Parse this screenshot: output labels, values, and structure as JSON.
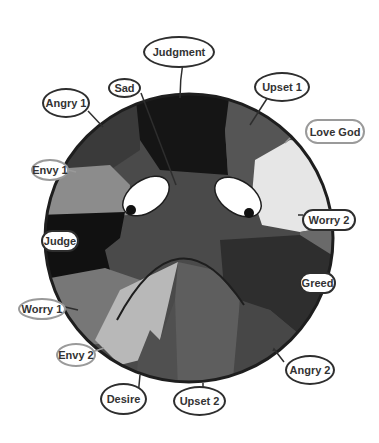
{
  "diagram": {
    "colors": {
      "outline": "#1e1e1e",
      "black_region": "#111111",
      "dark_gray": "#2f2f2f",
      "mid_dark_gray": "#444444",
      "mid_gray": "#5a5a5a",
      "gray": "#6e6e6e",
      "light_gray": "#8a8a8a",
      "pale_gray": "#b9b9b9",
      "near_white": "#ececec",
      "eye_white": "#ffffff",
      "pupil": "#111111"
    },
    "labels": [
      {
        "id": "judgment",
        "text": "Judgment"
      },
      {
        "id": "sad",
        "text": "Sad"
      },
      {
        "id": "angry1",
        "text": "Angry 1"
      },
      {
        "id": "upset1",
        "text": "Upset 1"
      },
      {
        "id": "love_god",
        "text": "Love God"
      },
      {
        "id": "envy1",
        "text": "Envy 1"
      },
      {
        "id": "worry2",
        "text": "Worry 2"
      },
      {
        "id": "judge",
        "text": "Judge"
      },
      {
        "id": "greed",
        "text": "Greed"
      },
      {
        "id": "worry1",
        "text": "Worry 1"
      },
      {
        "id": "envy2",
        "text": "Envy 2"
      },
      {
        "id": "angry2",
        "text": "Angry 2"
      },
      {
        "id": "desire",
        "text": "Desire"
      },
      {
        "id": "upset2",
        "text": "Upset 2"
      }
    ]
  }
}
